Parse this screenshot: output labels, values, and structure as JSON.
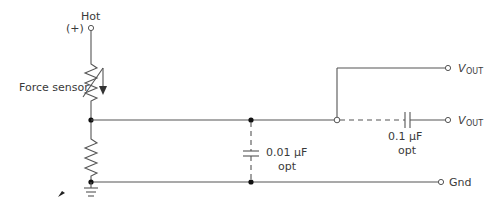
{
  "diagram": {
    "type": "circuit-schematic",
    "title": "",
    "labels": {
      "hot": "Hot",
      "hot_polarity": "(+)",
      "force_sensor": "Force sensor",
      "cap1_value": "0.01 µF",
      "cap1_note": "opt",
      "cap2_value": "0.1 µF",
      "cap2_note": "opt",
      "vout1_main": "V",
      "vout1_sub": "OUT",
      "vout2_main": "V",
      "vout2_sub": "OUT",
      "gnd": "Gnd"
    },
    "components": [
      {
        "id": "force-sensor",
        "kind": "variable-resistor",
        "label": "Force sensor"
      },
      {
        "id": "bottom-resistor",
        "kind": "resistor"
      },
      {
        "id": "cap1",
        "kind": "capacitor",
        "value": "0.01 µF",
        "optional": true
      },
      {
        "id": "cap2",
        "kind": "capacitor",
        "value": "0.1 µF",
        "optional": true
      },
      {
        "id": "ground",
        "kind": "ground"
      }
    ],
    "terminals": [
      "Hot (+)",
      "VOUT",
      "VOUT",
      "Gnd"
    ],
    "colors": {
      "line": "#555555",
      "text": "#3a3a3a",
      "background": "#ffffff"
    }
  }
}
